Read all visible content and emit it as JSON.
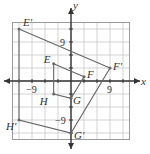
{
  "chart_data": {
    "type": "scatter",
    "title": "",
    "xlabel": "x",
    "ylabel": "y",
    "xlim": [
      -15,
      15
    ],
    "ylim": [
      -15,
      15
    ],
    "grid": true,
    "grid_step": 3,
    "tick_labels": {
      "x": [
        "-9",
        "9"
      ],
      "y": [
        "-9",
        "9"
      ]
    },
    "series": [
      {
        "name": "EFGH",
        "closed": true,
        "points": [
          {
            "label": "E",
            "x": -4,
            "y": 4
          },
          {
            "label": "F",
            "x": 3,
            "y": 1
          },
          {
            "label": "G",
            "x": 0,
            "y": -4
          },
          {
            "label": "H",
            "x": -4,
            "y": -3
          }
        ]
      },
      {
        "name": "E'F'G'H'",
        "closed": true,
        "points": [
          {
            "label": "E'",
            "x": -12,
            "y": 12
          },
          {
            "label": "F'",
            "x": 9,
            "y": 3
          },
          {
            "label": "G'",
            "x": 0,
            "y": -12
          },
          {
            "label": "H'",
            "x": -12,
            "y": -9
          }
        ]
      }
    ]
  },
  "axes": {
    "x_label": "x",
    "y_label": "y",
    "tick_pos": "9",
    "tick_neg": "−9"
  },
  "colors": {
    "grid": "#c8c8c8",
    "frame": "#9a9a9a",
    "axis": "#333333",
    "shape": "#666666"
  }
}
